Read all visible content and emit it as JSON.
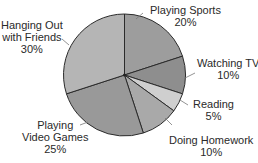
{
  "chart_data": {
    "type": "pie",
    "title": "",
    "start_angle_deg": 0,
    "direction": "clockwise",
    "center": [
      124.5,
      75
    ],
    "radius": 61,
    "slices": [
      {
        "label": "Playing Sports",
        "value": 20,
        "pct_label": "20%",
        "color": "#9d9d9d"
      },
      {
        "label": "Watching TV",
        "value": 10,
        "pct_label": "10%",
        "color": "#8e8e8e"
      },
      {
        "label": "Reading",
        "value": 5,
        "pct_label": "5%",
        "color": "#cfcfcf"
      },
      {
        "label": "Doing Homework",
        "value": 10,
        "pct_label": "10%",
        "color": "#a9a9a9"
      },
      {
        "label": "Playing Video Games",
        "value": 25,
        "pct_label": "25%",
        "color": "#999999"
      },
      {
        "label": "Hanging Out with Friends",
        "value": 30,
        "pct_label": "30%",
        "color": "#b5b5b5"
      }
    ]
  },
  "labels": [
    {
      "line1": "Playing Sports",
      "line2": "20%"
    },
    {
      "line1": "Watching TV",
      "line2": "10%"
    },
    {
      "line1": "Reading",
      "line2": "5%"
    },
    {
      "line1": "Doing Homework",
      "line2": "10%"
    },
    {
      "line1": "Playing",
      "line2": "Video Games",
      "line3": "25%"
    },
    {
      "line1": "Hanging Out",
      "line2": "with Friends",
      "line3": "30%"
    }
  ]
}
